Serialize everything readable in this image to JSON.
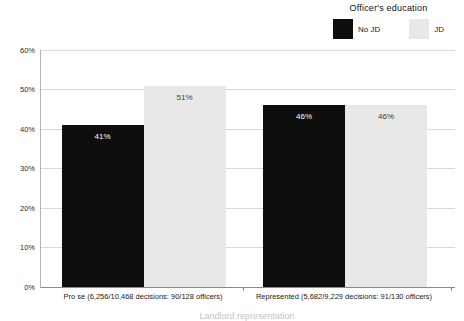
{
  "legend": {
    "title": "Officer's education",
    "items": [
      {
        "label": "No JD",
        "color": "#0e0e0e"
      },
      {
        "label": "JD",
        "color": "#e8e8e6"
      }
    ]
  },
  "chart_data": {
    "type": "bar",
    "title": "",
    "legend_title": "Officer's education",
    "legend_position": "top-right",
    "categories": [
      "Pro se (6,256/10,468 decisions: 90/128 officers)",
      "Represented (5,682/9,229 decisions: 91/130 officers)"
    ],
    "series": [
      {
        "name": "No JD",
        "color": "#0e0e0e",
        "label_color": "#ffffff",
        "values": [
          41,
          46
        ]
      },
      {
        "name": "JD",
        "color": "#e8e8e6",
        "label_color": "#3a3a3a",
        "values": [
          51,
          46
        ]
      }
    ],
    "value_labels": [
      [
        "41%",
        "46%"
      ],
      [
        "51%",
        "46%"
      ]
    ],
    "y_ticks": [
      "0%",
      "10%",
      "20%",
      "30%",
      "40%",
      "50%",
      "60%"
    ],
    "ylim": [
      0,
      60
    ],
    "grid": true,
    "xlabel": "Landlord representation",
    "ylabel": ""
  },
  "colors": {
    "background": "#ffffff",
    "gridline": "#d9d9d9",
    "y_axis_line": "#b5b5b5",
    "x_axis_line": "#8a8a8a",
    "tick_text": "#2b2b2b",
    "x_title_faint": "#c3c3c3"
  }
}
